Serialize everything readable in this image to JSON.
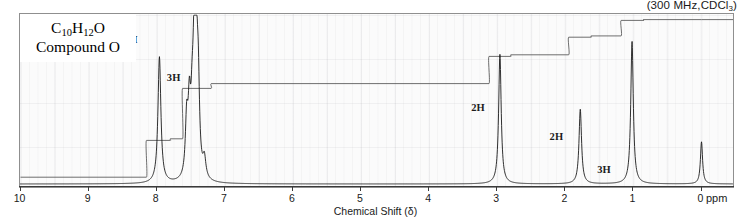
{
  "meta": {
    "conditions_prefix": "(300 MHz",
    "conditions_sep": ",",
    "solvent_main": "CDCl",
    "solvent_sub": "3",
    "conditions_suffix": ")"
  },
  "caption": {
    "formula_c": "C",
    "formula_c_sub": "10",
    "formula_h": "H",
    "formula_h_sub": "12",
    "formula_o": "O",
    "compound_name": "Compound O"
  },
  "axis": {
    "title": "Chemical Shift (δ)",
    "unit_label": "ppm",
    "ticks": [
      {
        "value": 10,
        "label": "10"
      },
      {
        "value": 9,
        "label": "9"
      },
      {
        "value": 8,
        "label": "8"
      },
      {
        "value": 7,
        "label": "7"
      },
      {
        "value": 6,
        "label": "6"
      },
      {
        "value": 5,
        "label": "5"
      },
      {
        "value": 4,
        "label": "4"
      },
      {
        "value": 3,
        "label": "3"
      },
      {
        "value": 2,
        "label": "2"
      },
      {
        "value": 1,
        "label": "1"
      },
      {
        "value": 0,
        "label": "0"
      }
    ],
    "min": 0,
    "max": 10,
    "direction": "reversed"
  },
  "integration_labels": [
    {
      "text": "2H",
      "ppm": 8.35,
      "y_frac": 0.845
    },
    {
      "text": "3H",
      "ppm": 7.72,
      "y_frac": 0.625
    },
    {
      "text": "2H",
      "ppm": 3.25,
      "y_frac": 0.45
    },
    {
      "text": "2H",
      "ppm": 2.1,
      "y_frac": 0.285
    },
    {
      "text": "3H",
      "ppm": 1.4,
      "y_frac": 0.095
    }
  ],
  "chart_data": {
    "type": "line",
    "subtitle": "(300 MHz, CDCl3)",
    "xlabel": "Chemical Shift (δ)",
    "ylabel": "",
    "xlim": [
      10,
      0
    ],
    "x_unit": "ppm",
    "grid": true,
    "legend": null,
    "peaks": [
      {
        "ppm": 7.96,
        "height": 0.78,
        "width": 0.03,
        "multiplicity": "d",
        "integration": "2H",
        "assignment": "aromatic ortho"
      },
      {
        "ppm": 7.56,
        "height": 0.34,
        "width": 0.026,
        "multiplicity": "m",
        "integration": "1H",
        "assignment": "aromatic para"
      },
      {
        "ppm": 7.52,
        "height": 0.4,
        "width": 0.026,
        "multiplicity": "m",
        "integration": ""
      },
      {
        "ppm": 7.48,
        "height": 0.3,
        "width": 0.026,
        "multiplicity": "m",
        "integration": ""
      },
      {
        "ppm": 7.45,
        "height": 0.66,
        "width": 0.026,
        "multiplicity": "m",
        "integration": "2H",
        "assignment": "aromatic meta"
      },
      {
        "ppm": 7.42,
        "height": 0.72,
        "width": 0.026,
        "multiplicity": "m",
        "integration": ""
      },
      {
        "ppm": 7.39,
        "height": 0.5,
        "width": 0.026,
        "multiplicity": "m",
        "integration": ""
      },
      {
        "ppm": 7.3,
        "height": 0.12,
        "width": 0.03,
        "multiplicity": "s",
        "integration": "",
        "assignment": "CHCl3 residual"
      },
      {
        "ppm": 2.96,
        "height": 0.8,
        "width": 0.026,
        "multiplicity": "t",
        "integration": "2H",
        "assignment": "COCH2"
      },
      {
        "ppm": 1.78,
        "height": 0.46,
        "width": 0.026,
        "multiplicity": "sext",
        "integration": "2H",
        "assignment": "CH2"
      },
      {
        "ppm": 1.02,
        "height": 0.88,
        "width": 0.026,
        "multiplicity": "t",
        "integration": "3H",
        "assignment": "CH3"
      },
      {
        "ppm": 0.0,
        "height": 0.26,
        "width": 0.022,
        "multiplicity": "s",
        "integration": "",
        "assignment": "TMS"
      }
    ],
    "integration_steps": [
      {
        "start_ppm": 10.0,
        "end_ppm": 8.15,
        "level": 0.005
      },
      {
        "start_ppm": 8.15,
        "end_ppm": 7.8,
        "level": 0.235
      },
      {
        "start_ppm": 7.8,
        "end_ppm": 7.62,
        "level": 0.245
      },
      {
        "start_ppm": 7.62,
        "end_ppm": 7.2,
        "level": 0.56
      },
      {
        "start_ppm": 7.2,
        "end_ppm": 3.12,
        "level": 0.59
      },
      {
        "start_ppm": 3.12,
        "end_ppm": 2.8,
        "level": 0.76
      },
      {
        "start_ppm": 2.8,
        "end_ppm": 1.95,
        "level": 0.77
      },
      {
        "start_ppm": 1.95,
        "end_ppm": 1.62,
        "level": 0.88
      },
      {
        "start_ppm": 1.62,
        "end_ppm": 1.18,
        "level": 0.888
      },
      {
        "start_ppm": 1.18,
        "end_ppm": 0.85,
        "level": 0.985
      },
      {
        "start_ppm": 0.85,
        "end_ppm": 0.0,
        "level": 0.99
      }
    ]
  }
}
